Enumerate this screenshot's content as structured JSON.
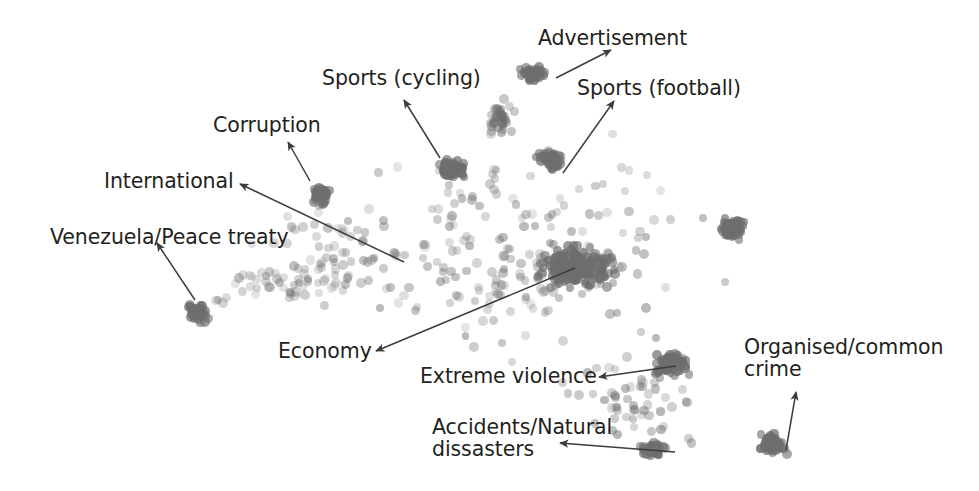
{
  "figure": {
    "width": 979,
    "height": 491,
    "background": "#ffffff",
    "point_color": "#6e6e6e",
    "text_color": "#231f20",
    "arrow_color": "#3c3c3c"
  },
  "annotations": [
    {
      "key": "advertisement",
      "label": "Advertisement",
      "x": 538,
      "y": 28,
      "align": "left"
    },
    {
      "key": "sports_cycling",
      "label": "Sports (cycling)",
      "x": 322,
      "y": 68,
      "align": "left"
    },
    {
      "key": "sports_football",
      "label": "Sports (football)",
      "x": 577,
      "y": 78,
      "align": "left"
    },
    {
      "key": "corruption",
      "label": "Corruption",
      "x": 213,
      "y": 115,
      "align": "left"
    },
    {
      "key": "international",
      "label": "International",
      "x": 104,
      "y": 171,
      "align": "left"
    },
    {
      "key": "venezuela_peace_treaty",
      "label": "Venezuela/Peace treaty",
      "x": 50,
      "y": 227,
      "align": "left"
    },
    {
      "key": "economy",
      "label": "Economy",
      "x": 278,
      "y": 341,
      "align": "left"
    },
    {
      "key": "extreme_violence",
      "label": "Extreme violence",
      "x": 420,
      "y": 366,
      "align": "left"
    },
    {
      "key": "organised_common_crime",
      "label": "Organised/common\ncrime",
      "x": 744,
      "y": 337,
      "align": "left"
    },
    {
      "key": "accidents_natural_dissasters",
      "label": "Accidents/Natural\ndissasters",
      "x": 432,
      "y": 417,
      "align": "left"
    }
  ],
  "arrows": [
    {
      "key": "arrow-advertisement",
      "from": [
        556,
        78
      ],
      "to": [
        611,
        50
      ],
      "head": "to"
    },
    {
      "key": "arrow-sports-cycling",
      "from": [
        440,
        158
      ],
      "to": [
        404,
        100
      ],
      "head": "to"
    },
    {
      "key": "arrow-sports-football",
      "from": [
        563,
        173
      ],
      "to": [
        614,
        101
      ],
      "head": "to"
    },
    {
      "key": "arrow-corruption",
      "from": [
        310,
        181
      ],
      "to": [
        288,
        142
      ],
      "head": "to"
    },
    {
      "key": "arrow-international",
      "from": [
        404,
        262
      ],
      "to": [
        240,
        184
      ],
      "head": "to"
    },
    {
      "key": "arrow-venezuela",
      "from": [
        195,
        300
      ],
      "to": [
        157,
        243
      ],
      "head": "to"
    },
    {
      "key": "arrow-economy",
      "from": [
        575,
        268
      ],
      "to": [
        376,
        351
      ],
      "head": "to"
    },
    {
      "key": "arrow-extreme-violence",
      "from": [
        676,
        366
      ],
      "to": [
        599,
        377
      ],
      "head": "to"
    },
    {
      "key": "arrow-organised-crime",
      "from": [
        786,
        450
      ],
      "to": [
        796,
        392
      ],
      "head": "to"
    },
    {
      "key": "arrow-accidents",
      "from": [
        675,
        452
      ],
      "to": [
        560,
        443
      ],
      "head": "to"
    }
  ],
  "chart_data": {
    "type": "scatter",
    "title": "",
    "xlabel": "",
    "ylabel": "",
    "xlim": [
      0,
      979
    ],
    "ylim": [
      0,
      491
    ],
    "grid": false,
    "legend": "none",
    "axes_visible": false,
    "marker": {
      "shape": "circle",
      "size_px": 9,
      "color": "#6e6e6e",
      "opacity_range": [
        0.18,
        0.85
      ]
    },
    "clusters": [
      {
        "name": "Advertisement",
        "cx": 534,
        "cy": 74,
        "rx": 28,
        "ry": 20,
        "n": 46,
        "density": "high"
      },
      {
        "name": "Sports (cycling)",
        "cx": 452,
        "cy": 170,
        "rx": 31,
        "ry": 21,
        "n": 52,
        "density": "high"
      },
      {
        "name": "Sports (football)",
        "cx": 551,
        "cy": 160,
        "rx": 30,
        "ry": 22,
        "n": 50,
        "density": "high"
      },
      {
        "name": "Corruption",
        "cx": 320,
        "cy": 195,
        "rx": 27,
        "ry": 19,
        "n": 42,
        "density": "high"
      },
      {
        "name": "Venezuela/Peace treaty",
        "cx": 197,
        "cy": 312,
        "rx": 24,
        "ry": 22,
        "n": 44,
        "density": "high"
      },
      {
        "name": "Economy (central mass)",
        "cx": 575,
        "cy": 268,
        "rx": 78,
        "ry": 42,
        "n": 200,
        "density": "high"
      },
      {
        "name": "Extreme violence",
        "cx": 672,
        "cy": 363,
        "rx": 38,
        "ry": 26,
        "n": 78,
        "density": "high"
      },
      {
        "name": "Organised/common crime",
        "cx": 772,
        "cy": 444,
        "rx": 31,
        "ry": 24,
        "n": 62,
        "density": "high"
      },
      {
        "name": "Accidents/Natural dissasters",
        "cx": 652,
        "cy": 450,
        "rx": 28,
        "ry": 17,
        "n": 40,
        "density": "high"
      },
      {
        "name": "unlabeled-right",
        "cx": 733,
        "cy": 228,
        "rx": 32,
        "ry": 24,
        "n": 64,
        "density": "high"
      },
      {
        "name": "unlabeled-upper-mid",
        "cx": 500,
        "cy": 120,
        "rx": 22,
        "ry": 30,
        "n": 34,
        "density": "medium"
      },
      {
        "name": "diffuse-left-tail",
        "cx": 300,
        "cy": 280,
        "rx": 90,
        "ry": 35,
        "n": 40,
        "density": "low"
      },
      {
        "name": "diffuse-halo",
        "cx": 520,
        "cy": 250,
        "rx": 210,
        "ry": 130,
        "n": 200,
        "density": "low"
      }
    ]
  }
}
